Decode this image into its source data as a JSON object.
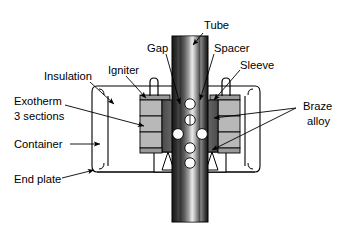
{
  "diagram": {
    "background_color": "#ffffff",
    "line_color": "#000000",
    "labels": {
      "tube": "Tube",
      "gap": "Gap",
      "spacer": "Spacer",
      "sleeve": "Sleeve",
      "igniter": "Igniter",
      "insulation": "Insulation",
      "exotherm_line1": "Exotherm",
      "exotherm_line2": "3 sections",
      "container": "Container",
      "end_plate": "End plate",
      "braze_line1": "Braze",
      "braze_line2": "alloy"
    },
    "colors": {
      "tube_dark": "#1a1a1a",
      "tube_mid": "#6e6e6e",
      "tube_light": "#f2f2f2",
      "exotherm_section": "#b5b5b5",
      "sleeve_dark": "#5a5a5a",
      "spacer_gray": "#8f8f8f",
      "plate_fill": "#ffffff",
      "outline": "#000000"
    },
    "parts": {
      "exotherm_section_count": 3,
      "tube_hole_count": 6,
      "igniter_count": 2
    }
  }
}
